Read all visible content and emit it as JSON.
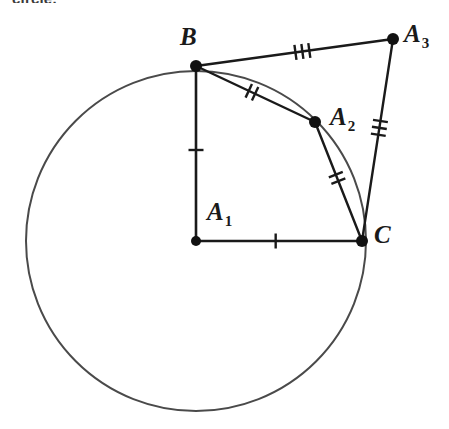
{
  "caption": {
    "text": "circle."
  },
  "figure": {
    "background_color": "#ffffff",
    "stroke_color": "#1a1a1a",
    "circle_stroke_color": "#4a4a4a",
    "point_color": "#111111"
  },
  "geometry": {
    "circle": {
      "name": "main-circle",
      "center_x": 196,
      "center_y": 241,
      "radius": 170,
      "stroke_width": 2
    },
    "points": [
      {
        "id": "A1",
        "label": "A",
        "subscript": "1",
        "x": 196,
        "y": 241,
        "label_x": 207,
        "label_y": 199,
        "radius": 5
      },
      {
        "id": "B",
        "label": "B",
        "subscript": "",
        "x": 196,
        "y": 66,
        "label_x": 180,
        "label_y": 24,
        "radius": 6
      },
      {
        "id": "A2",
        "label": "A",
        "subscript": "2",
        "x": 315,
        "y": 122,
        "label_x": 330,
        "label_y": 104,
        "radius": 6
      },
      {
        "id": "C",
        "label": "C",
        "subscript": "",
        "x": 362,
        "y": 241,
        "label_x": 374,
        "label_y": 222,
        "radius": 6
      },
      {
        "id": "A3",
        "label": "A",
        "subscript": "3",
        "x": 393,
        "y": 39,
        "label_x": 404,
        "label_y": 21,
        "radius": 6
      }
    ],
    "segments": [
      {
        "name": "segment-A1-B",
        "from": "A1",
        "to": "B",
        "x1": 196,
        "y1": 241,
        "x2": 196,
        "y2": 66,
        "ticks": 1,
        "tick_t": 0.52,
        "stroke_width": 2.6
      },
      {
        "name": "segment-A1-C",
        "from": "A1",
        "to": "C",
        "x1": 196,
        "y1": 241,
        "x2": 362,
        "y2": 241,
        "ticks": 1,
        "tick_t": 0.48,
        "stroke_width": 2.6
      },
      {
        "name": "segment-B-A2",
        "from": "B",
        "to": "A2",
        "x1": 196,
        "y1": 66,
        "x2": 315,
        "y2": 122,
        "ticks": 2,
        "tick_t": 0.47,
        "stroke_width": 2.4
      },
      {
        "name": "segment-A2-C",
        "from": "A2",
        "to": "C",
        "x1": 315,
        "y1": 122,
        "x2": 362,
        "y2": 241,
        "ticks": 2,
        "tick_t": 0.47,
        "stroke_width": 2.4
      },
      {
        "name": "segment-B-A3",
        "from": "B",
        "to": "A3",
        "x1": 196,
        "y1": 66,
        "x2": 393,
        "y2": 39,
        "ticks": 3,
        "tick_t": 0.54,
        "stroke_width": 2.4
      },
      {
        "name": "segment-A3-C",
        "from": "A3",
        "to": "C",
        "x1": 393,
        "y1": 39,
        "x2": 362,
        "y2": 241,
        "ticks": 3,
        "tick_t": 0.44,
        "stroke_width": 2.4
      }
    ],
    "tick_mark": {
      "length": 15,
      "spacing": 7,
      "stroke_width": 2.4
    }
  }
}
